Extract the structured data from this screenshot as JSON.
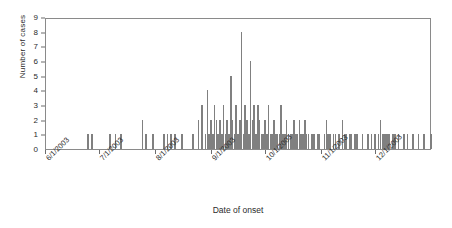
{
  "chart_data": {
    "type": "bar",
    "title": "",
    "subtitle": "",
    "xlabel": "Date of onset",
    "ylabel": "Number of cases",
    "ylim": [
      0,
      9
    ],
    "yticks": [
      0,
      1,
      2,
      3,
      4,
      5,
      6,
      7,
      8,
      9
    ],
    "grid": false,
    "legend": null,
    "xtick_labels": [
      "6/1/2003",
      "7/1/2003",
      "8/1/2003",
      "9/1/2003",
      "10/1/2003",
      "11/1/2003",
      "12/1/2003"
    ],
    "xtick_positions_days": [
      0,
      30,
      61,
      92,
      122,
      153,
      183
    ],
    "x_range_days": [
      0,
      213
    ],
    "x_unit": "days since 6/1/2003",
    "bar_color": "#808080",
    "categories": [
      "6/1/2003",
      "6/2/2003",
      "6/3/2003",
      "6/4/2003",
      "6/5/2003",
      "6/6/2003",
      "6/7/2003",
      "6/8/2003",
      "6/9/2003",
      "6/10/2003",
      "6/11/2003",
      "6/12/2003",
      "6/13/2003",
      "6/14/2003",
      "6/15/2003",
      "6/16/2003",
      "6/17/2003",
      "6/18/2003",
      "6/19/2003",
      "6/20/2003",
      "6/21/2003",
      "6/22/2003",
      "6/23/2003",
      "6/24/2003",
      "6/25/2003",
      "6/26/2003",
      "6/27/2003",
      "6/28/2003",
      "6/29/2003",
      "6/30/2003",
      "7/1/2003",
      "7/2/2003",
      "7/3/2003",
      "7/4/2003",
      "7/5/2003",
      "7/6/2003",
      "7/7/2003",
      "7/8/2003",
      "7/9/2003",
      "7/10/2003",
      "7/11/2003",
      "7/12/2003",
      "7/13/2003",
      "7/14/2003",
      "7/15/2003",
      "7/16/2003",
      "7/17/2003",
      "7/18/2003",
      "7/19/2003",
      "7/20/2003",
      "7/21/2003",
      "7/22/2003",
      "7/23/2003",
      "7/24/2003",
      "7/25/2003",
      "7/26/2003",
      "7/27/2003",
      "7/28/2003",
      "7/29/2003",
      "7/30/2003",
      "7/31/2003",
      "8/1/2003",
      "8/2/2003",
      "8/3/2003",
      "8/4/2003",
      "8/5/2003",
      "8/6/2003",
      "8/7/2003",
      "8/8/2003",
      "8/9/2003",
      "8/10/2003",
      "8/11/2003",
      "8/12/2003",
      "8/13/2003",
      "8/14/2003",
      "8/15/2003",
      "8/16/2003",
      "8/17/2003",
      "8/18/2003",
      "8/19/2003",
      "8/20/2003",
      "8/21/2003",
      "8/22/2003",
      "8/23/2003",
      "8/24/2003",
      "8/25/2003",
      "8/26/2003",
      "8/27/2003",
      "8/28/2003",
      "8/29/2003",
      "8/30/2003",
      "8/31/2003",
      "9/1/2003",
      "9/2/2003",
      "9/3/2003",
      "9/4/2003",
      "9/5/2003",
      "9/6/2003",
      "9/7/2003",
      "9/8/2003",
      "9/9/2003",
      "9/10/2003",
      "9/11/2003",
      "9/12/2003",
      "9/13/2003",
      "9/14/2003",
      "9/15/2003",
      "9/16/2003",
      "9/17/2003",
      "9/18/2003",
      "9/19/2003",
      "9/20/2003",
      "9/21/2003",
      "9/22/2003",
      "9/23/2003",
      "9/24/2003",
      "9/25/2003",
      "9/26/2003",
      "9/27/2003",
      "9/28/2003",
      "9/29/2003",
      "9/30/2003",
      "10/1/2003",
      "10/2/2003",
      "10/3/2003",
      "10/4/2003",
      "10/5/2003",
      "10/6/2003",
      "10/7/2003",
      "10/8/2003",
      "10/9/2003",
      "10/10/2003",
      "10/11/2003",
      "10/12/2003",
      "10/13/2003",
      "10/14/2003",
      "10/15/2003",
      "10/16/2003",
      "10/17/2003",
      "10/18/2003",
      "10/19/2003",
      "10/20/2003",
      "10/21/2003",
      "10/22/2003",
      "10/23/2003",
      "10/24/2003",
      "10/25/2003",
      "10/26/2003",
      "10/27/2003",
      "10/28/2003",
      "10/29/2003",
      "10/30/2003",
      "10/31/2003",
      "11/1/2003",
      "11/2/2003",
      "11/3/2003",
      "11/4/2003",
      "11/5/2003",
      "11/6/2003",
      "11/7/2003",
      "11/8/2003",
      "11/9/2003",
      "11/10/2003",
      "11/11/2003",
      "11/12/2003",
      "11/13/2003",
      "11/14/2003",
      "11/15/2003",
      "11/16/2003",
      "11/17/2003",
      "11/18/2003",
      "11/19/2003",
      "11/20/2003",
      "11/21/2003",
      "11/22/2003",
      "11/23/2003",
      "11/24/2003",
      "11/25/2003",
      "11/26/2003",
      "11/27/2003",
      "11/28/2003",
      "11/29/2003",
      "11/30/2003",
      "12/1/2003",
      "12/2/2003",
      "12/3/2003",
      "12/4/2003",
      "12/5/2003",
      "12/6/2003",
      "12/7/2003",
      "12/8/2003",
      "12/9/2003",
      "12/10/2003",
      "12/11/2003",
      "12/12/2003",
      "12/13/2003",
      "12/14/2003",
      "12/15/2003",
      "12/16/2003",
      "12/17/2003",
      "12/18/2003",
      "12/19/2003",
      "12/20/2003",
      "12/21/2003",
      "12/22/2003",
      "12/23/2003",
      "12/24/2003",
      "12/25/2003",
      "12/26/2003",
      "12/27/2003",
      "12/28/2003",
      "12/29/2003",
      "12/30/2003",
      "12/31/2003"
    ],
    "values": [
      0,
      0,
      0,
      0,
      0,
      0,
      0,
      0,
      0,
      0,
      0,
      0,
      0,
      0,
      0,
      0,
      0,
      0,
      0,
      0,
      0,
      0,
      0,
      1,
      0,
      1,
      0,
      0,
      0,
      0,
      0,
      0,
      0,
      0,
      0,
      1,
      0,
      0,
      1,
      0,
      0,
      1,
      0,
      0,
      0,
      0,
      0,
      0,
      0,
      0,
      0,
      0,
      0,
      2,
      0,
      1,
      0,
      0,
      0,
      1,
      0,
      0,
      0,
      0,
      0,
      1,
      0,
      1,
      0,
      1,
      0,
      1,
      0,
      0,
      0,
      1,
      0,
      0,
      0,
      0,
      0,
      1,
      0,
      0,
      2,
      0,
      3,
      0,
      1,
      4,
      1,
      2,
      1,
      3,
      2,
      1,
      2,
      1,
      3,
      1,
      2,
      1,
      5,
      2,
      1,
      3,
      1,
      2,
      8,
      1,
      3,
      2,
      1,
      6,
      2,
      3,
      1,
      3,
      2,
      1,
      1,
      2,
      1,
      3,
      1,
      1,
      2,
      1,
      1,
      1,
      3,
      1,
      1,
      2,
      1,
      1,
      1,
      2,
      1,
      1,
      2,
      1,
      1,
      2,
      1,
      1,
      0,
      1,
      1,
      0,
      1,
      1,
      0,
      0,
      1,
      2,
      1,
      1,
      0,
      1,
      1,
      0,
      1,
      0,
      2,
      1,
      1,
      0,
      1,
      1,
      0,
      1,
      1,
      0,
      0,
      1,
      0,
      0,
      1,
      0,
      1,
      0,
      1,
      0,
      1,
      2,
      1,
      1,
      1,
      1,
      1,
      0,
      1,
      1,
      0,
      1,
      0,
      0,
      1,
      0,
      1,
      0,
      0,
      1,
      0,
      0,
      1,
      0,
      0,
      1,
      0,
      0,
      0,
      1
    ]
  }
}
